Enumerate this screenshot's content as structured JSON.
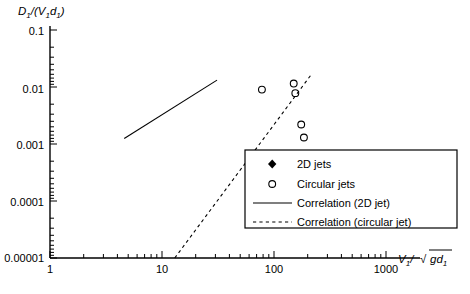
{
  "chart_data": {
    "type": "scatter",
    "title": "",
    "xlabel": "V1/√(gd1)",
    "ylabel": "D1/(V1d1)",
    "xscale": "log",
    "yscale": "log",
    "xlim": [
      1,
      1000
    ],
    "ylim": [
      1e-05,
      0.1
    ],
    "xticks": [
      "1",
      "10",
      "100",
      "1000"
    ],
    "yticks": [
      "0.1",
      "0.01",
      "0.001",
      "0.0001",
      "0.00001"
    ],
    "grid": false,
    "legend_position": "lower-right",
    "series": [
      {
        "name": "2D jets",
        "marker": "filled-diamond",
        "color": "#000000",
        "points": [
          [
            7.6,
            0.0017
          ],
          [
            9.4,
            0.019
          ],
          [
            9.2,
            0.0022
          ],
          [
            9.6,
            0.0034
          ],
          [
            10.5,
            0.0027
          ],
          [
            11.5,
            0.0063
          ],
          [
            11.2,
            0.0047
          ],
          [
            12.4,
            0.0046
          ],
          [
            12.0,
            0.0036
          ],
          [
            13.2,
            0.0072
          ],
          [
            13.0,
            0.0055
          ],
          [
            13.6,
            0.0012
          ],
          [
            14.5,
            0.0082
          ],
          [
            14.2,
            0.006
          ],
          [
            15.0,
            0.0044
          ],
          [
            15.5,
            0.0039
          ],
          [
            16.0,
            0.007
          ],
          [
            16.4,
            0.0052
          ],
          [
            16.8,
            0.0031
          ],
          [
            17.2,
            0.0086
          ],
          [
            17.6,
            0.0063
          ],
          [
            18.0,
            0.0048
          ],
          [
            18.5,
            0.0038
          ],
          [
            19.0,
            0.009
          ],
          [
            19.4,
            0.0074
          ],
          [
            19.8,
            0.0057
          ],
          [
            20.3,
            0.0043
          ],
          [
            20.8,
            0.0035
          ],
          [
            21.4,
            0.0096
          ],
          [
            22.0,
            0.008
          ],
          [
            22.6,
            0.0066
          ],
          [
            23.2,
            0.0052
          ],
          [
            24.0,
            0.0088
          ],
          [
            24.8,
            0.0071
          ],
          [
            25.6,
            0.0058
          ],
          [
            18.8,
            0.0024
          ],
          [
            17.0,
            0.0021
          ],
          [
            13.8,
            0.003
          ]
        ]
      },
      {
        "name": "Circular jets",
        "marker": "open-circle",
        "color": "#000000",
        "points": [
          [
            78,
            0.009
          ],
          [
            150,
            0.0115
          ],
          [
            155,
            0.0078
          ],
          [
            175,
            0.0022
          ],
          [
            185,
            0.0013
          ],
          [
            118,
            0.00031
          ],
          [
            120,
            0.00024
          ],
          [
            66,
            0.000115
          ],
          [
            67,
            9e-05
          ]
        ]
      }
    ],
    "lines": [
      {
        "name": "Correlation (2D jet)",
        "style": "solid",
        "from": [
          4.6,
          0.00125
        ],
        "to": [
          31.0,
          0.0132
        ]
      },
      {
        "name": "Correlation (circular jet)",
        "style": "dashed",
        "from": [
          13.0,
          1e-05
        ],
        "to": [
          215.0,
          0.0165
        ]
      }
    ],
    "legend": [
      {
        "label": "2D jets",
        "symbol": "filled-diamond"
      },
      {
        "label": "Circular jets",
        "symbol": "open-circle"
      },
      {
        "label": "Correlation (2D jet)",
        "symbol": "solid-line"
      },
      {
        "label": "Correlation (circular jet)",
        "symbol": "dashed-line"
      }
    ]
  },
  "axes": {
    "y_label_main": "D",
    "y_label_sub1": "1",
    "y_label_mid": "/(V",
    "y_label_sub2": "1",
    "y_label_d": "d",
    "y_label_sub3": "1",
    "y_label_close": ")",
    "x_label_main": "V",
    "x_label_sub1": "1",
    "x_label_div": "/",
    "x_label_radicand": "gd",
    "x_label_sub2": "1"
  }
}
